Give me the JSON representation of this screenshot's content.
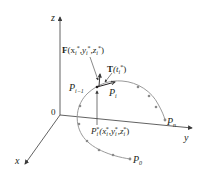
{
  "axes": {
    "x_label": "x",
    "y_label": "y",
    "z_label": "z",
    "origin_label": "0"
  },
  "labels": {
    "force": {
      "symbol": "F",
      "args": "(x",
      "sub_i": "i",
      "star": "*",
      "comma": ",",
      "y": "y",
      "z": "z",
      "close": ")"
    },
    "tangent": {
      "symbol": "T",
      "open": "(t",
      "sub_i": "i",
      "star": "*",
      "close": ")"
    },
    "p_i_minus_1": {
      "base": "P",
      "sub": "i−1"
    },
    "p_i": {
      "base": "P",
      "sub": "i"
    },
    "p_n": {
      "base": "P",
      "sub": "n"
    },
    "p_0": {
      "base": "P",
      "sub": "0"
    },
    "p_star": {
      "base": "P",
      "sub": "i",
      "star": "*",
      "args_open": "(x",
      "y": "y",
      "z": "z",
      "comma": ",",
      "close": ")"
    }
  },
  "colors": {
    "axis": "#3a3a3a",
    "curve": "#9a9a9a",
    "point": "#8a8a8a",
    "text": "#231f20"
  }
}
